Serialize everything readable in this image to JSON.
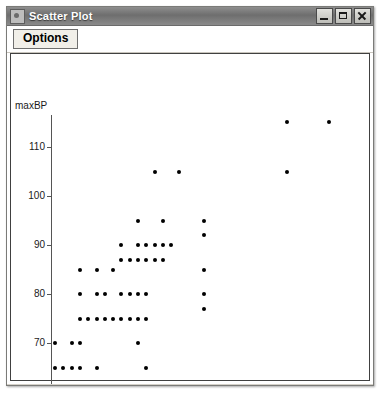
{
  "window": {
    "title": "Scatter Plot",
    "icon": "app-icon",
    "controls": [
      {
        "name": "minimize",
        "glyph": "minimize-icon"
      },
      {
        "name": "maximize",
        "glyph": "maximize-icon"
      },
      {
        "name": "close",
        "glyph": "close-icon"
      }
    ]
  },
  "toolbar": {
    "options_label": "Options"
  },
  "chart_data": {
    "type": "scatter",
    "title": "",
    "xlabel": "BP(60)",
    "ylabel": "maxBP",
    "xlim": [
      1.5,
      36.5
    ],
    "ylim": [
      58.5,
      116.5
    ],
    "xticks": [
      5,
      10,
      15,
      20,
      25,
      30,
      35
    ],
    "yticks": [
      60,
      70,
      80,
      90,
      100,
      110
    ],
    "xtick_labels": [
      "5",
      "10",
      "15",
      "20",
      "25",
      "30",
      "35"
    ],
    "ytick_labels": [
      "60",
      "70",
      "80",
      "90",
      "100",
      "110"
    ],
    "grid": false,
    "legend": null,
    "marker_color": "#000000",
    "points": [
      [
        2,
        70
      ],
      [
        2,
        65
      ],
      [
        3,
        65
      ],
      [
        3,
        60
      ],
      [
        4,
        60
      ],
      [
        4,
        65
      ],
      [
        4,
        70
      ],
      [
        5,
        65
      ],
      [
        5,
        70
      ],
      [
        5,
        75
      ],
      [
        5,
        80
      ],
      [
        5,
        85
      ],
      [
        6,
        75
      ],
      [
        7,
        65
      ],
      [
        7,
        75
      ],
      [
        7,
        80
      ],
      [
        7,
        85
      ],
      [
        8,
        75
      ],
      [
        8,
        80
      ],
      [
        9,
        75
      ],
      [
        9,
        85
      ],
      [
        10,
        75
      ],
      [
        10,
        80
      ],
      [
        10,
        87
      ],
      [
        10,
        90
      ],
      [
        11,
        75
      ],
      [
        11,
        80
      ],
      [
        11,
        87
      ],
      [
        12,
        70
      ],
      [
        12,
        75
      ],
      [
        12,
        80
      ],
      [
        12,
        87
      ],
      [
        12,
        90
      ],
      [
        12,
        95
      ],
      [
        13,
        65
      ],
      [
        13,
        75
      ],
      [
        13,
        80
      ],
      [
        13,
        87
      ],
      [
        13,
        90
      ],
      [
        14,
        87
      ],
      [
        14,
        90
      ],
      [
        14,
        105
      ],
      [
        15,
        87
      ],
      [
        15,
        90
      ],
      [
        15,
        95
      ],
      [
        16,
        90
      ],
      [
        17,
        105
      ],
      [
        20,
        77
      ],
      [
        20,
        80
      ],
      [
        20,
        85
      ],
      [
        20,
        92
      ],
      [
        20,
        95
      ],
      [
        30,
        105
      ],
      [
        30,
        115
      ],
      [
        35,
        115
      ]
    ]
  }
}
